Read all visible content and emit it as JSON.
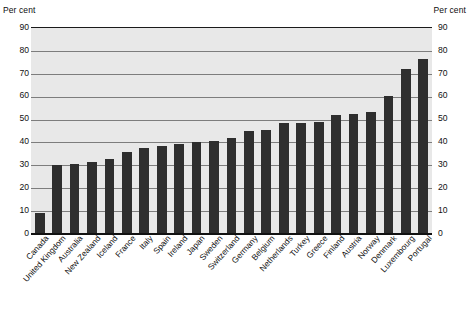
{
  "axis": {
    "unit_label_left": "Per cent",
    "unit_label_right": "Per cent",
    "y_ticks": [
      "90",
      "80",
      "70",
      "60",
      "50",
      "40",
      "30",
      "20",
      "10",
      "0"
    ]
  },
  "chart_data": {
    "type": "bar",
    "title": "",
    "subtitle": "",
    "xlabel": "",
    "ylabel": "Per cent",
    "ylim": [
      0,
      90
    ],
    "ytick_step": 10,
    "grid": true,
    "grid_axis": "y",
    "legend": false,
    "orientation": "vertical",
    "bar_color": "#2e2e2e",
    "plot_background": "#e8e8e8",
    "sorted": "ascending",
    "categories": [
      "Canada",
      "United Kingdom",
      "Australia",
      "New Zealand",
      "Iceland",
      "France",
      "Italy",
      "Spain",
      "Ireland",
      "Japan",
      "Sweden",
      "Switzerland",
      "Germany",
      "Belgium",
      "Netherlands",
      "Turkey",
      "Greece",
      "Finland",
      "Austria",
      "Norway",
      "Denmark",
      "Luxembourg",
      "Portugal"
    ],
    "values": [
      8.7,
      29.5,
      30.0,
      31.0,
      32.3,
      35.6,
      37.2,
      37.8,
      39.0,
      39.6,
      40.2,
      41.4,
      44.6,
      45.0,
      48.0,
      48.2,
      48.4,
      51.5,
      52.2,
      52.7,
      59.7,
      71.5,
      76.2
    ]
  }
}
